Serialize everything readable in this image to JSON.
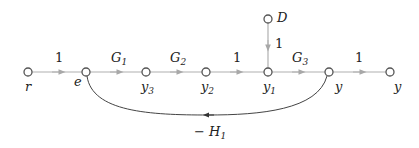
{
  "diagram": {
    "type": "signal-flow-graph",
    "nodes": [
      {
        "id": "r",
        "label": "r",
        "sub": ""
      },
      {
        "id": "e",
        "label": "e",
        "sub": ""
      },
      {
        "id": "y3",
        "label": "y",
        "sub": "3"
      },
      {
        "id": "y2",
        "label": "y",
        "sub": "2"
      },
      {
        "id": "y1",
        "label": "y",
        "sub": "1"
      },
      {
        "id": "y",
        "label": "y",
        "sub": ""
      },
      {
        "id": "yout",
        "label": "y",
        "sub": ""
      },
      {
        "id": "D",
        "label": "D",
        "sub": ""
      }
    ],
    "branches": [
      {
        "from": "r",
        "to": "e",
        "gain": "1",
        "gain_sub": ""
      },
      {
        "from": "e",
        "to": "y3",
        "gain": "G",
        "gain_sub": "1"
      },
      {
        "from": "y3",
        "to": "y2",
        "gain": "G",
        "gain_sub": "2"
      },
      {
        "from": "y2",
        "to": "y1",
        "gain": "1",
        "gain_sub": ""
      },
      {
        "from": "y1",
        "to": "y",
        "gain": "G",
        "gain_sub": "3"
      },
      {
        "from": "y",
        "to": "yout",
        "gain": "1",
        "gain_sub": ""
      },
      {
        "from": "D",
        "to": "y1",
        "gain": "1",
        "gain_sub": ""
      },
      {
        "from": "y",
        "to": "e",
        "gain": "− H",
        "gain_sub": "1"
      }
    ],
    "colors": {
      "branch": "#b0b0b0",
      "node": "#555555",
      "feedback": "#444444",
      "arrow": "#999999"
    }
  }
}
